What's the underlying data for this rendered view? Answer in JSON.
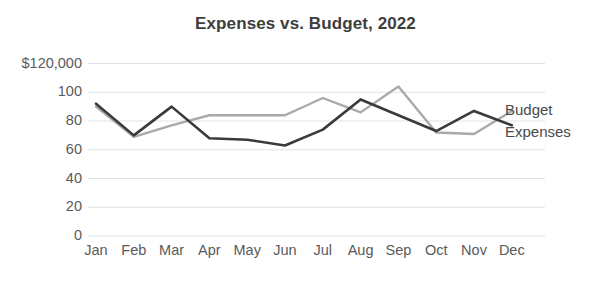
{
  "chart_data": {
    "type": "line",
    "title": "Expenses vs. Budget, 2022",
    "xlabel": "",
    "ylabel": "",
    "categories": [
      "Jan",
      "Feb",
      "Mar",
      "Apr",
      "May",
      "Jun",
      "Jul",
      "Aug",
      "Sep",
      "Oct",
      "Nov",
      "Dec"
    ],
    "series": [
      {
        "name": "Budget",
        "color": "#a9a9a9",
        "values": [
          90,
          69,
          77,
          84,
          84,
          84,
          96,
          86,
          104,
          72,
          71,
          87
        ]
      },
      {
        "name": "Expenses",
        "color": "#3a3a3a",
        "values": [
          92,
          70,
          90,
          68,
          67,
          63,
          74,
          95,
          84,
          73,
          87,
          77
        ]
      }
    ],
    "ylim": [
      0,
      120
    ],
    "yticks": [
      0,
      20,
      40,
      60,
      80,
      100,
      120
    ],
    "ytick_labels": [
      "0",
      "20",
      "40",
      "60",
      "80",
      "100",
      "$120,000"
    ],
    "grid": true,
    "legend_position": "right-inline"
  }
}
